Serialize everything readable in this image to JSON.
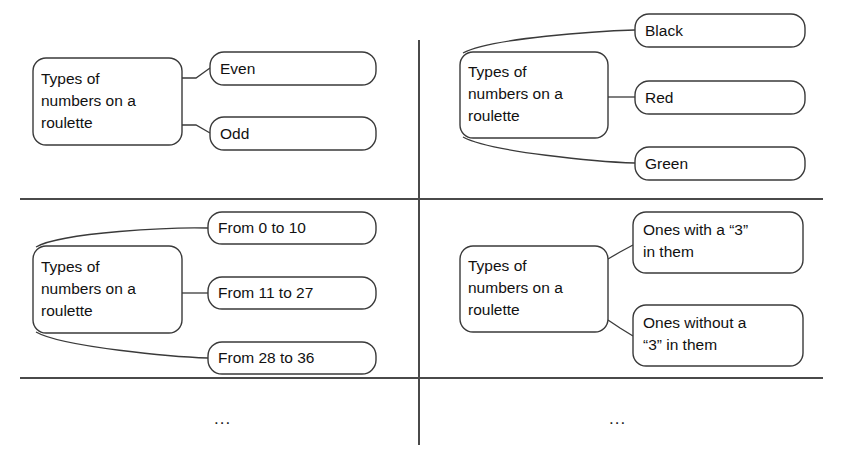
{
  "diagram": {
    "root_label": "Types of numbers on a roulette",
    "root_label_lines": [
      "Types of",
      "numbers on a",
      "roulette"
    ],
    "colors": {
      "background": "#ffffff",
      "stroke": "#3a3a3a",
      "divider": "#4a4a4a",
      "text": "#111111"
    },
    "ellipsis": "...",
    "quadrants": [
      {
        "id": "parity",
        "position": "top-left",
        "root": {
          "lines": [
            "Types of",
            "numbers on a",
            "roulette"
          ],
          "x": 33,
          "y": 58,
          "w": 149,
          "h": 87
        },
        "children": [
          {
            "lines": [
              "Even"
            ],
            "x": 210,
            "y": 52,
            "w": 166,
            "h": 33
          },
          {
            "lines": [
              "Odd"
            ],
            "x": 210,
            "y": 117,
            "w": 166,
            "h": 33
          }
        ]
      },
      {
        "id": "color",
        "position": "top-right",
        "root": {
          "lines": [
            "Types of",
            "numbers on a",
            "roulette"
          ],
          "x": 460,
          "y": 52,
          "w": 148,
          "h": 86
        },
        "children": [
          {
            "lines": [
              "Black"
            ],
            "x": 635,
            "y": 14,
            "w": 170,
            "h": 33
          },
          {
            "lines": [
              "Red"
            ],
            "x": 635,
            "y": 81,
            "w": 170,
            "h": 33
          },
          {
            "lines": [
              "Green"
            ],
            "x": 635,
            "y": 147,
            "w": 170,
            "h": 33
          }
        ]
      },
      {
        "id": "range",
        "position": "bottom-left",
        "root": {
          "lines": [
            "Types of",
            "numbers on a",
            "roulette"
          ],
          "x": 33,
          "y": 246,
          "w": 149,
          "h": 87
        },
        "children": [
          {
            "lines": [
              "From 0 to 10"
            ],
            "x": 208,
            "y": 212,
            "w": 168,
            "h": 32
          },
          {
            "lines": [
              "From 11 to 27"
            ],
            "x": 208,
            "y": 277,
            "w": 168,
            "h": 32
          },
          {
            "lines": [
              "From 28 to 36"
            ],
            "x": 208,
            "y": 342,
            "w": 168,
            "h": 32
          }
        ]
      },
      {
        "id": "contains-three",
        "position": "bottom-right",
        "root": {
          "lines": [
            "Types of",
            "numbers on a",
            "roulette"
          ],
          "x": 460,
          "y": 246,
          "w": 148,
          "h": 86
        },
        "children": [
          {
            "lines": [
              "Ones with a “3”",
              "in them"
            ],
            "x": 633,
            "y": 212,
            "w": 170,
            "h": 61
          },
          {
            "lines": [
              "Ones without a",
              "“3” in them"
            ],
            "x": 633,
            "y": 305,
            "w": 170,
            "h": 61
          }
        ]
      }
    ],
    "dividers": {
      "horizontal": [
        {
          "name": "divider-top",
          "x1": 20,
          "y1": 199,
          "x2": 823,
          "y2": 199
        },
        {
          "name": "divider-bottom",
          "x1": 20,
          "y1": 378,
          "x2": 823,
          "y2": 378
        }
      ],
      "vertical": [
        {
          "name": "divider-center",
          "x1": 419,
          "y1": 40,
          "x2": 419,
          "y2": 445
        }
      ]
    },
    "ellipsis_marks": [
      {
        "name": "ellipsis-left",
        "x": 214,
        "y": 424
      },
      {
        "name": "ellipsis-right",
        "x": 609,
        "y": 424
      }
    ]
  }
}
